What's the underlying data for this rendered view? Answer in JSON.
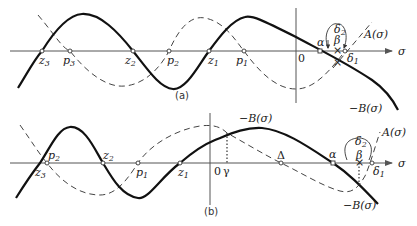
{
  "panels": [
    {
      "id": "a",
      "caption": "(a)",
      "axis_label": "σ",
      "origin_label": "0",
      "curve_labels": {
        "A": "A(σ)",
        "negB": "−B(σ)"
      },
      "points": [
        {
          "name": "z",
          "sub": "3",
          "x": 42
        },
        {
          "name": "p",
          "sub": "3",
          "x": 70
        },
        {
          "name": "z",
          "sub": "2",
          "x": 133
        },
        {
          "name": "p",
          "sub": "2",
          "x": 169
        },
        {
          "name": "z",
          "sub": "1",
          "x": 209
        },
        {
          "name": "p",
          "sub": "1",
          "x": 244
        }
      ],
      "greek": {
        "alpha": "α",
        "beta": "β",
        "delta1": "δ",
        "delta1_sub": "1",
        "delta2": "δ",
        "delta2_sub": "2"
      }
    },
    {
      "id": "b",
      "caption": "(b)",
      "axis_label": "σ",
      "origin_label": "0",
      "curve_labels": {
        "A": "A(σ)",
        "negB_top": "−B(σ)",
        "negB": "−B(σ)"
      },
      "points": [
        {
          "name": "p",
          "sub": "2",
          "x": 47
        },
        {
          "name": "z",
          "sub": "3",
          "x": 40
        },
        {
          "name": "z",
          "sub": "2",
          "x": 103
        },
        {
          "name": "p",
          "sub": "1",
          "x": 138
        },
        {
          "name": "z",
          "sub": "1",
          "x": 180
        }
      ],
      "greek": {
        "gamma": "γ",
        "Delta": "Δ",
        "alpha": "α",
        "beta": "β",
        "delta1": "δ",
        "delta1_sub": "1",
        "delta2": "δ",
        "delta2_sub": "2"
      }
    }
  ]
}
